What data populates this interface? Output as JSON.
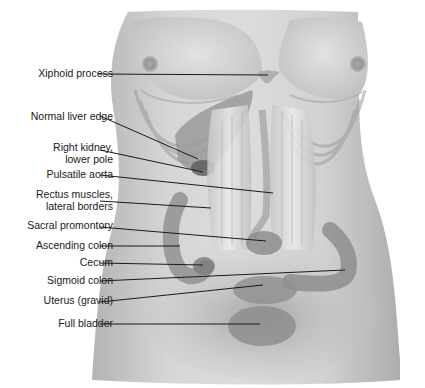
{
  "figure": {
    "colors": {
      "skin": "#c8c8c8",
      "skin_light": "#e0e0e0",
      "shadow": "#8e8e8e",
      "organ": "#7a7a7a",
      "leader_line": "#1a1a1a",
      "text": "#1a1a1a",
      "background": "#ffffff"
    }
  },
  "labels": [
    {
      "id": "xiphoid",
      "lines": [
        "Xiphoid process"
      ],
      "x": 20,
      "y": 67,
      "w": 93,
      "target": [
        268,
        75
      ],
      "anchor": [
        98,
        74
      ]
    },
    {
      "id": "liver",
      "lines": [
        "Normal liver edge"
      ],
      "x": 8,
      "y": 110,
      "w": 105,
      "target": [
        198,
        159
      ],
      "anchor": [
        100,
        116
      ]
    },
    {
      "id": "kidney",
      "lines": [
        "Right kidney,",
        "lower pole"
      ],
      "x": 30,
      "y": 141,
      "w": 83,
      "target": [
        203,
        172
      ],
      "anchor": [
        100,
        150
      ]
    },
    {
      "id": "aorta",
      "lines": [
        "Pulsatile aorta"
      ],
      "x": 20,
      "y": 168,
      "w": 93,
      "target": [
        273,
        193
      ],
      "anchor": [
        100,
        175
      ]
    },
    {
      "id": "rectus",
      "lines": [
        "Rectus muscles,",
        "lateral borders"
      ],
      "x": 14,
      "y": 188,
      "w": 99,
      "target": [
        211,
        208
      ],
      "anchor": [
        100,
        201
      ]
    },
    {
      "id": "sacral",
      "lines": [
        "Sacral promontory"
      ],
      "x": 4,
      "y": 219,
      "w": 109,
      "target": [
        266,
        241
      ],
      "anchor": [
        100,
        227
      ]
    },
    {
      "id": "ascending",
      "lines": [
        "Ascending colon"
      ],
      "x": 14,
      "y": 239,
      "w": 99,
      "target": [
        180,
        246
      ],
      "anchor": [
        100,
        246
      ]
    },
    {
      "id": "cecum",
      "lines": [
        "Cecum"
      ],
      "x": 40,
      "y": 256,
      "w": 73,
      "target": [
        203,
        265
      ],
      "anchor": [
        100,
        263
      ]
    },
    {
      "id": "sigmoid",
      "lines": [
        "Sigmoid colon"
      ],
      "x": 24,
      "y": 274,
      "w": 89,
      "target": [
        345,
        270
      ],
      "anchor": [
        100,
        281
      ]
    },
    {
      "id": "uterus",
      "lines": [
        "Uterus (gravid)"
      ],
      "x": 20,
      "y": 294,
      "w": 93,
      "target": [
        263,
        285
      ],
      "anchor": [
        100,
        302
      ]
    },
    {
      "id": "bladder",
      "lines": [
        "Full bladder"
      ],
      "x": 36,
      "y": 317,
      "w": 77,
      "target": [
        260,
        324
      ],
      "anchor": [
        100,
        324
      ]
    }
  ]
}
